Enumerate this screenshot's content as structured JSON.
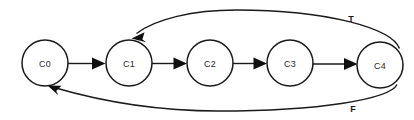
{
  "diagram": {
    "type": "state-transition-diagram",
    "canvas": {
      "width": 414,
      "height": 120,
      "background": "#ffffff"
    },
    "stroke_color": "#1a1a1a",
    "node_fill": "#ffffff",
    "nodes": [
      {
        "id": "C0",
        "label": "C0",
        "cx": 45,
        "cy": 63,
        "r": 23
      },
      {
        "id": "C1",
        "label": "C1",
        "cx": 129,
        "cy": 63,
        "r": 23
      },
      {
        "id": "C2",
        "label": "C2",
        "cx": 210,
        "cy": 63,
        "r": 23
      },
      {
        "id": "C3",
        "label": "C3",
        "cx": 290,
        "cy": 63,
        "r": 23
      },
      {
        "id": "C4",
        "label": "C4",
        "cx": 380,
        "cy": 65,
        "r": 23
      }
    ],
    "edges": [
      {
        "id": "e-c0-c1",
        "from": "C0",
        "to": "C1",
        "label": "",
        "shape": "straight"
      },
      {
        "id": "e-c1-c2",
        "from": "C1",
        "to": "C2",
        "label": "",
        "shape": "straight"
      },
      {
        "id": "e-c2-c3",
        "from": "C2",
        "to": "C3",
        "label": "",
        "shape": "straight"
      },
      {
        "id": "e-c3-c4",
        "from": "C3",
        "to": "C4",
        "label": "",
        "shape": "straight"
      },
      {
        "id": "e-c4-c1",
        "from": "C4",
        "to": "C1",
        "label": "T",
        "shape": "curve-top"
      },
      {
        "id": "e-c4-c0",
        "from": "C4",
        "to": "C0",
        "label": "F",
        "shape": "curve-bottom"
      }
    ],
    "labels": {
      "true_branch": "T",
      "false_branch": "F",
      "true_label_x": 351,
      "true_label_y": 19,
      "false_label_x": 353,
      "false_label_y": 109
    }
  }
}
